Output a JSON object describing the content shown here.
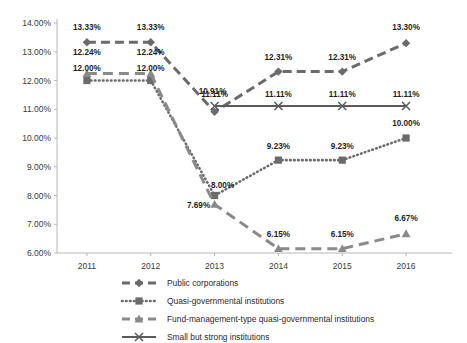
{
  "chart_data": {
    "type": "line",
    "title": "",
    "subtitle": "",
    "xlabel": "",
    "ylabel": "",
    "categories": [
      "2011",
      "2012",
      "2013",
      "2014",
      "2015",
      "2016"
    ],
    "ylim": [
      6.0,
      14.0
    ],
    "ytick_step": 1.0,
    "ytick_labels": [
      "6.00%",
      "7.00%",
      "8.00%",
      "9.00%",
      "10.00%",
      "11.00%",
      "12.00%",
      "13.00%",
      "14.00%"
    ],
    "ytick_values": [
      6.0,
      7.0,
      8.0,
      9.0,
      10.0,
      11.0,
      12.0,
      13.0,
      14.0
    ],
    "grid": false,
    "legend_position": "bottom",
    "value_suffix": "%",
    "series": [
      {
        "name": "Public corporations",
        "marker": "diamond",
        "dash": "dashed",
        "color": "#6b6b6b",
        "x": [
          "2011",
          "2012",
          "2013",
          "2014",
          "2015",
          "2016"
        ],
        "values": [
          13.33,
          13.33,
          10.91,
          12.31,
          12.31,
          13.3
        ],
        "labels": [
          "13.33%",
          "13.33%",
          "10.91%",
          "12.31%",
          "12.31%",
          "13.30%"
        ]
      },
      {
        "name": "Quasi-governmental institutions",
        "marker": "square",
        "dash": "dotted",
        "color": "#6b6b6b",
        "x": [
          "2011",
          "2012",
          "2013",
          "2014",
          "2015",
          "2016"
        ],
        "values": [
          12.0,
          12.0,
          8.0,
          9.23,
          9.23,
          10.0
        ],
        "labels": [
          "12.00%",
          "12.00%",
          "8.00%",
          "9.23%",
          "9.23%",
          "10.00%"
        ]
      },
      {
        "name": "Fund-management-type quasi-governmental institutions",
        "marker": "triangle",
        "dash": "long-dashed",
        "color": "#8a8a8a",
        "x": [
          "2011",
          "2012",
          "2013",
          "2014",
          "2015",
          "2016"
        ],
        "values": [
          12.24,
          12.24,
          7.69,
          6.15,
          6.15,
          6.67
        ],
        "labels": [
          "12.24%",
          "12.24%",
          "7.69%",
          "6.15%",
          "6.15%",
          "6.67%"
        ]
      },
      {
        "name": "Small but strong institutions",
        "marker": "x",
        "dash": "solid",
        "color": "#5a5a5a",
        "x": [
          "2013",
          "2014",
          "2015",
          "2016"
        ],
        "values": [
          11.11,
          11.11,
          11.11,
          11.11
        ],
        "labels": [
          "11.11%",
          "11.11%",
          "11.11%",
          "11.11%"
        ]
      }
    ]
  },
  "legend": {
    "items": [
      {
        "label": "Public corporations"
      },
      {
        "label": "Quasi-governmental institutions"
      },
      {
        "label": "Fund-management-type quasi-governmental institutions"
      },
      {
        "label": "Small but strong institutions"
      }
    ]
  }
}
